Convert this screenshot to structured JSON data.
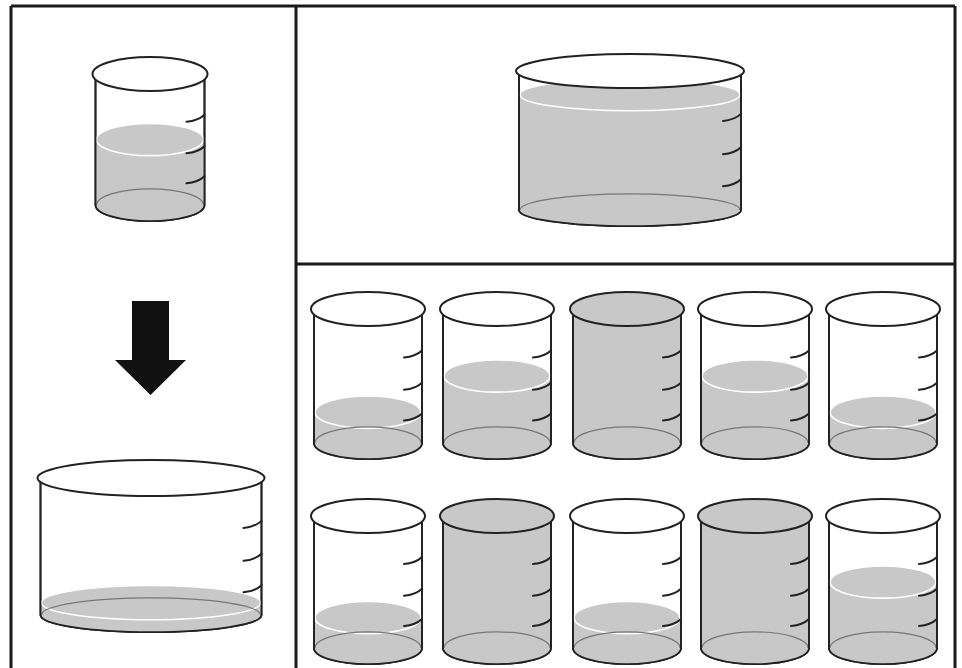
{
  "figure": {
    "colors": {
      "frame": "#1a1a1a",
      "liquid": "#c8c8c8",
      "outline": "#222222",
      "background": "#ffffff",
      "arrow": "#111111"
    }
  },
  "panels": {
    "left": {
      "top_beaker": {
        "id": "source-beaker",
        "type": "narrow",
        "fill_level": "half",
        "ticks": 3
      },
      "arrow": {
        "icon": "arrow-down-icon",
        "direction": "down"
      },
      "bottom_beaker": {
        "id": "result-wide-beaker",
        "type": "wide",
        "fill_level": "very-low",
        "ticks": 3
      }
    },
    "top_right": {
      "beaker": {
        "id": "reference-wide-beaker",
        "type": "wide",
        "fill_level": "near-full",
        "ticks": 3
      }
    },
    "options": {
      "rows": [
        [
          {
            "index": 1,
            "fill_level": "low"
          },
          {
            "index": 2,
            "fill_level": "medium"
          },
          {
            "index": 3,
            "fill_level": "full"
          },
          {
            "index": 4,
            "fill_level": "medium"
          },
          {
            "index": 5,
            "fill_level": "low"
          }
        ],
        [
          {
            "index": 6,
            "fill_level": "low"
          },
          {
            "index": 7,
            "fill_level": "full"
          },
          {
            "index": 8,
            "fill_level": "low"
          },
          {
            "index": 9,
            "fill_level": "full"
          },
          {
            "index": 10,
            "fill_level": "medium"
          }
        ]
      ]
    }
  }
}
